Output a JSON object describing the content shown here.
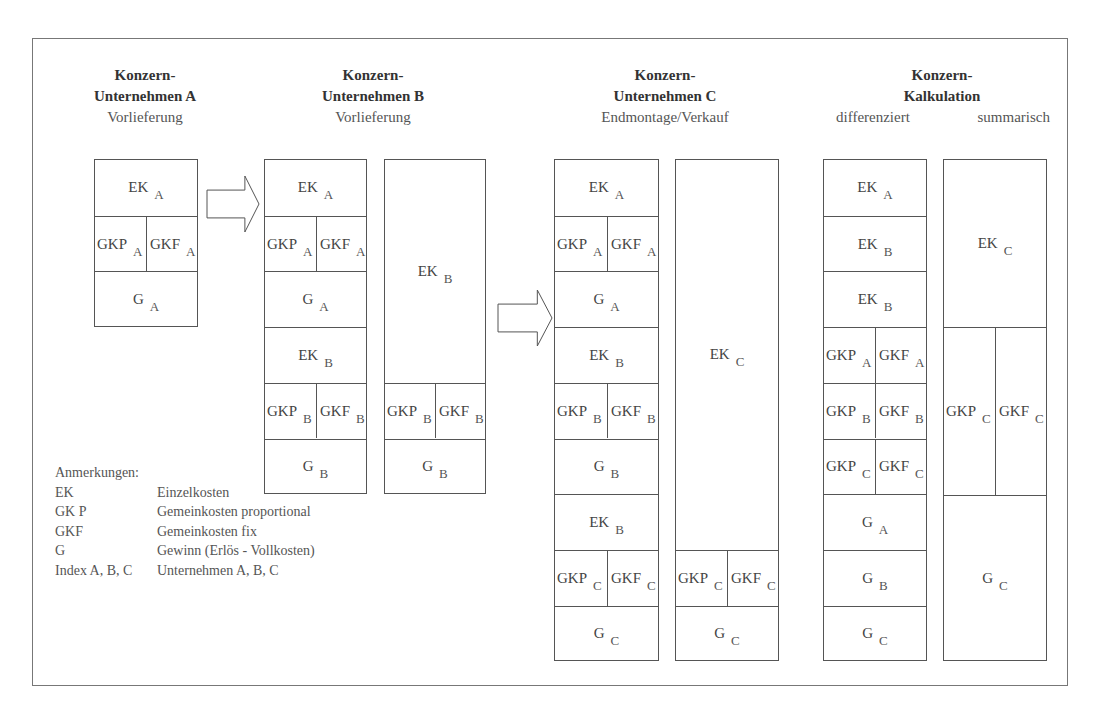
{
  "headers": [
    {
      "title": "Konzern-",
      "subtitle": "Unternehmen A",
      "desc": "Vorlieferung",
      "x": 35,
      "y": 65
    },
    {
      "title": "Konzern-",
      "subtitle": "Unternehmen B",
      "desc": "Vorlieferung",
      "x": 263,
      "y": 65
    },
    {
      "title": "Konzern-",
      "subtitle": "Unternehmen C",
      "desc": "Endmontage/Verkauf",
      "x": 555,
      "y": 65
    },
    {
      "title": "Konzern-",
      "subtitle": "Kalkulation",
      "desc_left": "differenziert",
      "desc_right": "summarisch",
      "x": 832,
      "y": 65
    }
  ],
  "columns": [
    {
      "name": "unternehmen-a",
      "x": 94,
      "y": 159,
      "w": 104,
      "cells": [
        {
          "h": 55.7,
          "parts": [
            {
              "t": "EK",
              "s": "A"
            }
          ]
        },
        {
          "h": 55.7,
          "parts": [
            {
              "t": "GKP",
              "s": "A"
            },
            {
              "t": "GKF",
              "s": "A"
            }
          ]
        },
        {
          "h": 55.7,
          "parts": [
            {
              "t": "G",
              "s": "A"
            }
          ]
        }
      ]
    },
    {
      "name": "unternehmen-b-detail",
      "x": 264,
      "y": 159,
      "w": 103,
      "cells": [
        {
          "h": 55.7,
          "parts": [
            {
              "t": "EK",
              "s": "A"
            }
          ]
        },
        {
          "h": 55.7,
          "parts": [
            {
              "t": "GKP",
              "s": "A"
            },
            {
              "t": "GKF",
              "s": "A"
            }
          ]
        },
        {
          "h": 55.7,
          "parts": [
            {
              "t": "G",
              "s": "A"
            }
          ]
        },
        {
          "h": 55.7,
          "parts": [
            {
              "t": "EK",
              "s": "B"
            }
          ]
        },
        {
          "h": 55.7,
          "parts": [
            {
              "t": "GKP",
              "s": "B"
            },
            {
              "t": "GKF",
              "s": "B"
            }
          ]
        },
        {
          "h": 55.7,
          "parts": [
            {
              "t": "G",
              "s": "B"
            }
          ]
        }
      ]
    },
    {
      "name": "unternehmen-b-summary",
      "x": 384,
      "y": 159,
      "w": 102,
      "cells": [
        {
          "h": 222.8,
          "parts": [
            {
              "t": "EK",
              "s": "B"
            }
          ]
        },
        {
          "h": 55.7,
          "parts": [
            {
              "t": "GKP",
              "s": "B"
            },
            {
              "t": "GKF",
              "s": "B"
            }
          ]
        },
        {
          "h": 55.7,
          "parts": [
            {
              "t": "G",
              "s": "B"
            }
          ]
        }
      ]
    },
    {
      "name": "unternehmen-c-detail",
      "x": 554,
      "y": 159,
      "w": 105,
      "cells": [
        {
          "h": 55.7,
          "parts": [
            {
              "t": "EK",
              "s": "A"
            }
          ]
        },
        {
          "h": 55.7,
          "parts": [
            {
              "t": "GKP",
              "s": "A"
            },
            {
              "t": "GKF",
              "s": "A"
            }
          ]
        },
        {
          "h": 55.7,
          "parts": [
            {
              "t": "G",
              "s": "A"
            }
          ]
        },
        {
          "h": 55.7,
          "parts": [
            {
              "t": "EK",
              "s": "B"
            }
          ]
        },
        {
          "h": 55.7,
          "parts": [
            {
              "t": "GKP",
              "s": "B"
            },
            {
              "t": "GKF",
              "s": "B"
            }
          ]
        },
        {
          "h": 55.7,
          "parts": [
            {
              "t": "G",
              "s": "B"
            }
          ]
        },
        {
          "h": 55.7,
          "parts": [
            {
              "t": "EK",
              "s": "B"
            }
          ]
        },
        {
          "h": 55.7,
          "parts": [
            {
              "t": "GKP",
              "s": "C"
            },
            {
              "t": "GKF",
              "s": "C"
            }
          ]
        },
        {
          "h": 55.7,
          "parts": [
            {
              "t": "G",
              "s": "C"
            }
          ]
        }
      ]
    },
    {
      "name": "unternehmen-c-summary",
      "x": 675,
      "y": 159,
      "w": 104,
      "cells": [
        {
          "h": 389.9,
          "parts": [
            {
              "t": "EK",
              "s": "C"
            }
          ]
        },
        {
          "h": 55.7,
          "parts": [
            {
              "t": "GKP",
              "s": "C"
            },
            {
              "t": "GKF",
              "s": "C"
            }
          ]
        },
        {
          "h": 55.7,
          "parts": [
            {
              "t": "G",
              "s": "C"
            }
          ]
        }
      ]
    },
    {
      "name": "kalkulation-differenziert",
      "x": 823,
      "y": 159,
      "w": 104,
      "cells": [
        {
          "h": 55.7,
          "parts": [
            {
              "t": "EK",
              "s": "A"
            }
          ]
        },
        {
          "h": 55.7,
          "parts": [
            {
              "t": "EK",
              "s": "B"
            }
          ]
        },
        {
          "h": 55.7,
          "parts": [
            {
              "t": "EK",
              "s": "B"
            }
          ]
        },
        {
          "h": 55.7,
          "parts": [
            {
              "t": "GKP",
              "s": "A"
            },
            {
              "t": "GKF",
              "s": "A"
            }
          ]
        },
        {
          "h": 55.7,
          "parts": [
            {
              "t": "GKP",
              "s": "B"
            },
            {
              "t": "GKF",
              "s": "B"
            }
          ]
        },
        {
          "h": 55.7,
          "parts": [
            {
              "t": "GKP",
              "s": "C"
            },
            {
              "t": "GKF",
              "s": "C"
            }
          ]
        },
        {
          "h": 55.7,
          "parts": [
            {
              "t": "G",
              "s": "A"
            }
          ]
        },
        {
          "h": 55.7,
          "parts": [
            {
              "t": "G",
              "s": "B"
            }
          ]
        },
        {
          "h": 55.7,
          "parts": [
            {
              "t": "G",
              "s": "C"
            }
          ]
        }
      ]
    },
    {
      "name": "kalkulation-summarisch",
      "x": 943,
      "y": 159,
      "w": 104,
      "cells": [
        {
          "h": 167,
          "parts": [
            {
              "t": "EK",
              "s": "C"
            }
          ]
        },
        {
          "h": 168,
          "parts": [
            {
              "t": "GKP",
              "s": "C"
            },
            {
              "t": "GKF",
              "s": "C"
            }
          ]
        },
        {
          "h": 166,
          "parts": [
            {
              "t": "G",
              "s": "C"
            }
          ]
        }
      ]
    }
  ],
  "arrows": [
    {
      "x": 206,
      "y": 175,
      "w": 54,
      "h": 58
    },
    {
      "x": 497,
      "y": 289,
      "w": 56,
      "h": 58
    }
  ],
  "legend": {
    "title": "Anmerkungen:",
    "items": [
      {
        "key": "EK",
        "value": "Einzelkosten"
      },
      {
        "key": "GK P",
        "value": "Gemeinkosten proportional"
      },
      {
        "key": "GKF",
        "value": "Gemeinkosten fix"
      },
      {
        "key": "G",
        "value": "Gewinn (Erlös - Vollkosten)"
      },
      {
        "key": "Index A, B, C",
        "value": "Unternehmen A, B, C"
      }
    ]
  }
}
